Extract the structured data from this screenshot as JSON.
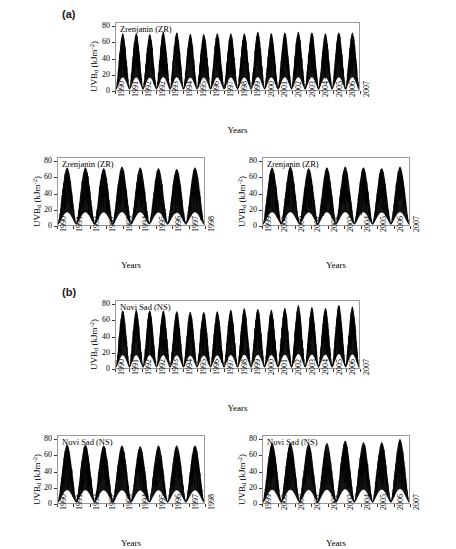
{
  "figure": {
    "background": "#ffffff",
    "axis_color": "#9a9a9a",
    "series_color": "#000000"
  },
  "panels": [
    {
      "id": "a",
      "label": "(a)"
    },
    {
      "id": "b",
      "label": "(b)"
    }
  ],
  "charts": [
    {
      "key": "zr_full",
      "panel": "a",
      "series_title": "Zrenjanin (ZR)",
      "xlabel": "Years",
      "ylabel_main": "UVB",
      "ylabel_sub": "d",
      "ylabel_unit_open": " (kJm",
      "ylabel_sup": "-2",
      "ylabel_unit_close": ")",
      "yticks": [
        "0",
        "20",
        "40",
        "60",
        "80"
      ],
      "xticks": [
        "1990",
        "1991",
        "1992",
        "1992",
        "1993",
        "1994",
        "1995",
        "1996",
        "1997",
        "1998",
        "1999",
        "2000",
        "2001",
        "2002",
        "2003",
        "2004",
        "2005",
        "2006",
        "2007"
      ]
    },
    {
      "key": "zr_early",
      "panel": "a",
      "series_title": "Zrenjanin (ZR)",
      "xlabel": "Years",
      "ylabel_main": "UVB",
      "ylabel_sub": "d",
      "ylabel_unit_open": " (kJm",
      "ylabel_sup": "-2",
      "ylabel_unit_close": ")",
      "yticks": [
        "0",
        "20",
        "40",
        "60",
        "80"
      ],
      "xticks": [
        "1990",
        "1991",
        "1992",
        "1992",
        "1993",
        "1994",
        "1995",
        "1996",
        "1997",
        "1998"
      ]
    },
    {
      "key": "zr_late",
      "panel": "a",
      "series_title": "Zrenjanin (ZR)",
      "xlabel": "Years",
      "ylabel_main": "UVB",
      "ylabel_sub": "d",
      "ylabel_unit_open": " (kJm",
      "ylabel_sup": "-2",
      "ylabel_unit_close": ")",
      "yticks": [
        "0",
        "20",
        "40",
        "60",
        "80"
      ],
      "xticks": [
        "1999",
        "2000",
        "2000",
        "2001",
        "2002",
        "2003",
        "2004",
        "2005",
        "2006",
        "2007"
      ]
    },
    {
      "key": "ns_full",
      "panel": "b",
      "series_title": "Novi Sad (NS)",
      "xlabel": "Years",
      "ylabel_main": "UVB",
      "ylabel_sub": "d",
      "ylabel_unit_open": " (kJm",
      "ylabel_sup": "-2",
      "ylabel_unit_close": ")",
      "yticks": [
        "0",
        "20",
        "40",
        "60",
        "80"
      ],
      "xticks": [
        "1990",
        "1991",
        "1992",
        "1992",
        "1993",
        "1994",
        "1995",
        "1996",
        "1997",
        "1998",
        "1999",
        "2000",
        "2001",
        "2002",
        "2003",
        "2004",
        "2005",
        "2006",
        "2007"
      ]
    },
    {
      "key": "ns_early",
      "panel": "b",
      "series_title": "Novi Sad (NS)",
      "xlabel": "Years",
      "ylabel_main": "UVB",
      "ylabel_sub": "d",
      "ylabel_unit_open": " (kJm",
      "ylabel_sup": "-2",
      "ylabel_unit_close": ")",
      "yticks": [
        "0",
        "20",
        "40",
        "60",
        "80"
      ],
      "xticks": [
        "1990",
        "1991",
        "1992",
        "1992",
        "1993",
        "1994",
        "1995",
        "1996",
        "1997",
        "1998"
      ]
    },
    {
      "key": "ns_late",
      "panel": "b",
      "series_title": "Novi Sad (NS)",
      "xlabel": "Years",
      "ylabel_main": "UVB",
      "ylabel_sub": "d",
      "ylabel_unit_open": " (kJm",
      "ylabel_sup": "-2",
      "ylabel_unit_close": ")",
      "yticks": [
        "0",
        "20",
        "40",
        "60",
        "80"
      ],
      "xticks": [
        "1999",
        "2000",
        "2000",
        "2001",
        "2002",
        "2003",
        "2004",
        "2005",
        "2006",
        "2007"
      ]
    }
  ],
  "chart_data": [
    {
      "key": "zr_full",
      "type": "line",
      "title": "Zrenjanin (ZR)",
      "xlabel": "Years",
      "ylabel": "UVBd (kJm-2)",
      "ylim": [
        0,
        85
      ],
      "yticks": [
        0,
        20,
        40,
        60,
        80
      ],
      "grid": false,
      "legend": "none",
      "x_start_year": 1990,
      "x_end_year": 2007,
      "description": "Daily erythemal UV-B dose time series, strongly seasonal sinusoidal envelope, 18 annual cycles",
      "annual_cycles": [
        {
          "year": 1990,
          "summer_peak_max": 72,
          "summer_peak_mean": 58,
          "winter_min": 2
        },
        {
          "year": 1991,
          "summer_peak_max": 72,
          "summer_peak_mean": 57,
          "winter_min": 2
        },
        {
          "year": 1992,
          "summer_peak_max": 71,
          "summer_peak_mean": 57,
          "winter_min": 2
        },
        {
          "year": 1993,
          "summer_peak_max": 74,
          "summer_peak_mean": 59,
          "winter_min": 2
        },
        {
          "year": 1994,
          "summer_peak_max": 73,
          "summer_peak_mean": 58,
          "winter_min": 2
        },
        {
          "year": 1995,
          "summer_peak_max": 71,
          "summer_peak_mean": 56,
          "winter_min": 2
        },
        {
          "year": 1996,
          "summer_peak_max": 71,
          "summer_peak_mean": 56,
          "winter_min": 2
        },
        {
          "year": 1997,
          "summer_peak_max": 72,
          "summer_peak_mean": 57,
          "winter_min": 2
        },
        {
          "year": 1998,
          "summer_peak_max": 72,
          "summer_peak_mean": 57,
          "winter_min": 2
        },
        {
          "year": 1999,
          "summer_peak_max": 72,
          "summer_peak_mean": 57,
          "winter_min": 2
        },
        {
          "year": 2000,
          "summer_peak_max": 74,
          "summer_peak_mean": 59,
          "winter_min": 2
        },
        {
          "year": 2001,
          "summer_peak_max": 72,
          "summer_peak_mean": 57,
          "winter_min": 2
        },
        {
          "year": 2002,
          "summer_peak_max": 73,
          "summer_peak_mean": 58,
          "winter_min": 2
        },
        {
          "year": 2003,
          "summer_peak_max": 74,
          "summer_peak_mean": 59,
          "winter_min": 2
        },
        {
          "year": 2004,
          "summer_peak_max": 73,
          "summer_peak_mean": 58,
          "winter_min": 2
        },
        {
          "year": 2005,
          "summer_peak_max": 72,
          "summer_peak_mean": 57,
          "winter_min": 2
        },
        {
          "year": 2006,
          "summer_peak_max": 73,
          "summer_peak_mean": 58,
          "winter_min": 2
        },
        {
          "year": 2007,
          "summer_peak_max": 73,
          "summer_peak_mean": 58,
          "winter_min": 2
        }
      ]
    },
    {
      "key": "zr_early",
      "type": "line",
      "title": "Zrenjanin (ZR)",
      "xlabel": "Years",
      "ylabel": "UVBd (kJm-2)",
      "ylim": [
        0,
        85
      ],
      "yticks": [
        0,
        20,
        40,
        60,
        80
      ],
      "grid": false,
      "legend": "none",
      "x_start_year": 1990,
      "x_end_year": 1998,
      "description": "Zoomed first half of the Zrenjanin record, 1990-1998",
      "annual_cycles": [
        {
          "year": 1990,
          "summer_peak_max": 73,
          "summer_peak_mean": 58,
          "winter_min": 2
        },
        {
          "year": 1991,
          "summer_peak_max": 73,
          "summer_peak_mean": 58,
          "winter_min": 2
        },
        {
          "year": 1992,
          "summer_peak_max": 72,
          "summer_peak_mean": 57,
          "winter_min": 2
        },
        {
          "year": 1993,
          "summer_peak_max": 74,
          "summer_peak_mean": 59,
          "winter_min": 2
        },
        {
          "year": 1994,
          "summer_peak_max": 73,
          "summer_peak_mean": 58,
          "winter_min": 2
        },
        {
          "year": 1995,
          "summer_peak_max": 72,
          "summer_peak_mean": 57,
          "winter_min": 2
        },
        {
          "year": 1996,
          "summer_peak_max": 71,
          "summer_peak_mean": 56,
          "winter_min": 2
        },
        {
          "year": 1997,
          "summer_peak_max": 73,
          "summer_peak_mean": 58,
          "winter_min": 2
        }
      ]
    },
    {
      "key": "zr_late",
      "type": "line",
      "title": "Zrenjanin (ZR)",
      "xlabel": "Years",
      "ylabel": "UVBd (kJm-2)",
      "ylim": [
        0,
        85
      ],
      "yticks": [
        0,
        20,
        40,
        60,
        80
      ],
      "grid": false,
      "legend": "none",
      "x_start_year": 1999,
      "x_end_year": 2007,
      "description": "Zoomed second half of the Zrenjanin record, 1999-2007",
      "annual_cycles": [
        {
          "year": 1999,
          "summer_peak_max": 73,
          "summer_peak_mean": 58,
          "winter_min": 2
        },
        {
          "year": 2000,
          "summer_peak_max": 74,
          "summer_peak_mean": 59,
          "winter_min": 2
        },
        {
          "year": 2001,
          "summer_peak_max": 72,
          "summer_peak_mean": 57,
          "winter_min": 2
        },
        {
          "year": 2002,
          "summer_peak_max": 73,
          "summer_peak_mean": 58,
          "winter_min": 2
        },
        {
          "year": 2003,
          "summer_peak_max": 74,
          "summer_peak_mean": 59,
          "winter_min": 2
        },
        {
          "year": 2004,
          "summer_peak_max": 73,
          "summer_peak_mean": 58,
          "winter_min": 2
        },
        {
          "year": 2005,
          "summer_peak_max": 72,
          "summer_peak_mean": 57,
          "winter_min": 2
        },
        {
          "year": 2006,
          "summer_peak_max": 74,
          "summer_peak_mean": 59,
          "winter_min": 2
        }
      ]
    },
    {
      "key": "ns_full",
      "type": "line",
      "title": "Novi Sad (NS)",
      "xlabel": "Years",
      "ylabel": "UVBd (kJm-2)",
      "ylim": [
        0,
        85
      ],
      "yticks": [
        0,
        20,
        40,
        60,
        80
      ],
      "grid": false,
      "legend": "none",
      "x_start_year": 1990,
      "x_end_year": 2007,
      "description": "Daily erythemal UV-B dose time series at Novi Sad; peaks rise slightly after 2002 reaching ~80 kJ m-2",
      "annual_cycles": [
        {
          "year": 1990,
          "summer_peak_max": 73,
          "summer_peak_mean": 58,
          "winter_min": 2
        },
        {
          "year": 1991,
          "summer_peak_max": 74,
          "summer_peak_mean": 58,
          "winter_min": 2
        },
        {
          "year": 1992,
          "summer_peak_max": 73,
          "summer_peak_mean": 57,
          "winter_min": 2
        },
        {
          "year": 1993,
          "summer_peak_max": 73,
          "summer_peak_mean": 58,
          "winter_min": 2
        },
        {
          "year": 1994,
          "summer_peak_max": 72,
          "summer_peak_mean": 57,
          "winter_min": 2
        },
        {
          "year": 1995,
          "summer_peak_max": 71,
          "summer_peak_mean": 56,
          "winter_min": 2
        },
        {
          "year": 1996,
          "summer_peak_max": 71,
          "summer_peak_mean": 56,
          "winter_min": 2
        },
        {
          "year": 1997,
          "summer_peak_max": 72,
          "summer_peak_mean": 57,
          "winter_min": 2
        },
        {
          "year": 1998,
          "summer_peak_max": 74,
          "summer_peak_mean": 58,
          "winter_min": 2
        },
        {
          "year": 1999,
          "summer_peak_max": 76,
          "summer_peak_mean": 59,
          "winter_min": 2
        },
        {
          "year": 2000,
          "summer_peak_max": 75,
          "summer_peak_mean": 59,
          "winter_min": 2
        },
        {
          "year": 2001,
          "summer_peak_max": 74,
          "summer_peak_mean": 58,
          "winter_min": 2
        },
        {
          "year": 2002,
          "summer_peak_max": 76,
          "summer_peak_mean": 59,
          "winter_min": 2
        },
        {
          "year": 2003,
          "summer_peak_max": 80,
          "summer_peak_mean": 62,
          "winter_min": 2
        },
        {
          "year": 2004,
          "summer_peak_max": 77,
          "summer_peak_mean": 60,
          "winter_min": 2
        },
        {
          "year": 2005,
          "summer_peak_max": 76,
          "summer_peak_mean": 59,
          "winter_min": 2
        },
        {
          "year": 2006,
          "summer_peak_max": 80,
          "summer_peak_mean": 61,
          "winter_min": 2
        },
        {
          "year": 2007,
          "summer_peak_max": 78,
          "summer_peak_mean": 60,
          "winter_min": 2
        }
      ]
    },
    {
      "key": "ns_early",
      "type": "line",
      "title": "Novi Sad (NS)",
      "xlabel": "Years",
      "ylabel": "UVBd (kJm-2)",
      "ylim": [
        0,
        85
      ],
      "yticks": [
        0,
        20,
        40,
        60,
        80
      ],
      "grid": false,
      "legend": "none",
      "x_start_year": 1990,
      "x_end_year": 1998,
      "description": "Zoomed first half of the Novi Sad record, 1990-1998",
      "annual_cycles": [
        {
          "year": 1990,
          "summer_peak_max": 74,
          "summer_peak_mean": 58,
          "winter_min": 2
        },
        {
          "year": 1991,
          "summer_peak_max": 74,
          "summer_peak_mean": 58,
          "winter_min": 2
        },
        {
          "year": 1992,
          "summer_peak_max": 73,
          "summer_peak_mean": 57,
          "winter_min": 2
        },
        {
          "year": 1993,
          "summer_peak_max": 73,
          "summer_peak_mean": 58,
          "winter_min": 2
        },
        {
          "year": 1994,
          "summer_peak_max": 72,
          "summer_peak_mean": 57,
          "winter_min": 2
        },
        {
          "year": 1995,
          "summer_peak_max": 73,
          "summer_peak_mean": 57,
          "winter_min": 2
        },
        {
          "year": 1996,
          "summer_peak_max": 73,
          "summer_peak_mean": 58,
          "winter_min": 2
        },
        {
          "year": 1997,
          "summer_peak_max": 73,
          "summer_peak_mean": 58,
          "winter_min": 2
        }
      ]
    },
    {
      "key": "ns_late",
      "type": "line",
      "title": "Novi Sad (NS)",
      "xlabel": "Years",
      "ylabel": "UVBd (kJm-2)",
      "ylim": [
        0,
        85
      ],
      "yticks": [
        0,
        20,
        40,
        60,
        80
      ],
      "grid": false,
      "legend": "none",
      "x_start_year": 1999,
      "x_end_year": 2007,
      "description": "Zoomed second half of the Novi Sad record, 1999-2007; highest peaks near 80 kJ m-2",
      "annual_cycles": [
        {
          "year": 1999,
          "summer_peak_max": 76,
          "summer_peak_mean": 59,
          "winter_min": 2
        },
        {
          "year": 2000,
          "summer_peak_max": 76,
          "summer_peak_mean": 59,
          "winter_min": 2
        },
        {
          "year": 2001,
          "summer_peak_max": 75,
          "summer_peak_mean": 58,
          "winter_min": 2
        },
        {
          "year": 2002,
          "summer_peak_max": 76,
          "summer_peak_mean": 59,
          "winter_min": 2
        },
        {
          "year": 2003,
          "summer_peak_max": 79,
          "summer_peak_mean": 61,
          "winter_min": 2
        },
        {
          "year": 2004,
          "summer_peak_max": 77,
          "summer_peak_mean": 60,
          "winter_min": 2
        },
        {
          "year": 2005,
          "summer_peak_max": 77,
          "summer_peak_mean": 60,
          "winter_min": 2
        },
        {
          "year": 2006,
          "summer_peak_max": 81,
          "summer_peak_mean": 62,
          "winter_min": 2
        }
      ]
    }
  ]
}
